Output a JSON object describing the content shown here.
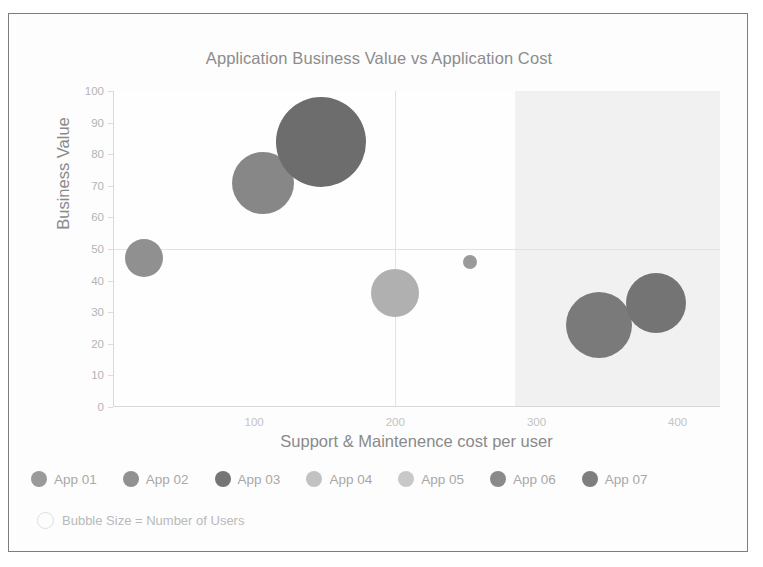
{
  "chart_data": {
    "type": "scatter",
    "title": "Application Business Value vs Application Cost",
    "xlabel": "Support & Maintenence cost per user",
    "ylabel": "Business Value",
    "xlim": [
      0,
      430
    ],
    "ylim": [
      0,
      100
    ],
    "xticks": [
      100,
      200,
      300,
      400
    ],
    "yticks": [
      0,
      10,
      20,
      30,
      40,
      50,
      60,
      70,
      80,
      90,
      100
    ],
    "grid": true,
    "legend_position": "bottom",
    "size_note": "Bubble Size = Number of Users",
    "size_encoding": "Bubble Size = Number of Users",
    "quadrant_shade": {
      "x_from": 285,
      "x_to": 430,
      "color": "#f1f1f1"
    },
    "highlight_gridlines": {
      "y": 50,
      "x": 200
    },
    "series": [
      {
        "name": "App 01",
        "x": 22,
        "y": 47,
        "size": 19,
        "color": "#909090"
      },
      {
        "name": "App 02",
        "x": 106,
        "y": 71,
        "size": 31,
        "color": "#878787"
      },
      {
        "name": "App 03",
        "x": 147,
        "y": 84,
        "size": 45,
        "color": "#6d6d6d"
      },
      {
        "name": "App 04",
        "x": 200,
        "y": 36,
        "size": 24,
        "color": "#b0b0b0"
      },
      {
        "name": "App 05",
        "x": 253,
        "y": 46,
        "size": 7,
        "color": "#9a9a9a"
      },
      {
        "name": "App 06",
        "x": 344,
        "y": 26,
        "size": 33,
        "color": "#7a7a7a"
      },
      {
        "name": "App 07",
        "x": 385,
        "y": 33,
        "size": 30,
        "color": "#747474"
      }
    ]
  },
  "legend": {
    "items": [
      {
        "label": "App 01",
        "color": "#9a9a9a"
      },
      {
        "label": "App 02",
        "color": "#919191"
      },
      {
        "label": "App 03",
        "color": "#757575"
      },
      {
        "label": "App 04",
        "color": "#c2c2c2"
      },
      {
        "label": "App 05",
        "color": "#c8c8c8"
      },
      {
        "label": "App 06",
        "color": "#8a8a8a"
      },
      {
        "label": "App 07",
        "color": "#7e7e7e"
      }
    ]
  },
  "colors": {
    "title": "#8c8c8c",
    "axis_title": "#8a8a8a",
    "tick_label": "#b9b9b9",
    "gridline": "#e2e2e2",
    "frame_border": "#7d7d7d",
    "shade": "#f1f1f1",
    "background": "#fdfdfd"
  }
}
